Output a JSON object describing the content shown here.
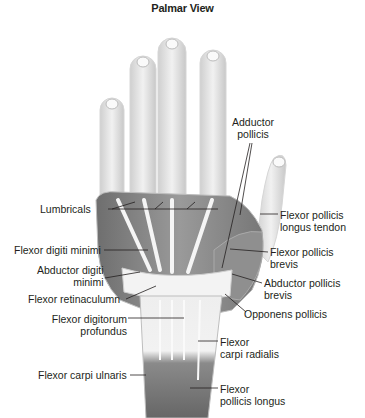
{
  "title": "Palmar View",
  "labels": {
    "adductor_pollicis": [
      "Adductor",
      "pollicis"
    ],
    "lumbricals": "Lumbricals",
    "flexor_pollicis_longus_tendon": [
      "Flexor pollicis",
      "longus tendon"
    ],
    "flexor_digiti_minimi": "Flexor digiti minimi",
    "flexor_pollicis_brevis": [
      "Flexor pollicis",
      "brevis"
    ],
    "abductor_digiti_minimi": [
      "Abductor digiti",
      "minimi"
    ],
    "abductor_pollicis_brevis": [
      "Abductor pollicis",
      "brevis"
    ],
    "flexor_retinaculum": "Flexor retinaculumn",
    "opponens_pollicis": "Opponens pollicis",
    "flexor_digitorum_profundus": [
      "Flexor digitorum",
      "profundus"
    ],
    "flexor_carpi_radialis": [
      "Flexor",
      "carpi radialis"
    ],
    "flexor_carpi_ulnaris": "Flexor carpi ulnaris",
    "flexor_pollicis_longus": [
      "Flexor",
      "pollicis longus"
    ]
  },
  "colors": {
    "bone": "#e6e6e6",
    "muscle_dark": "#7d7d7d",
    "muscle_mid": "#a3a3a3",
    "tendon": "#f4f4f4",
    "outline": "#c9c9c9",
    "text": "#231f20"
  }
}
